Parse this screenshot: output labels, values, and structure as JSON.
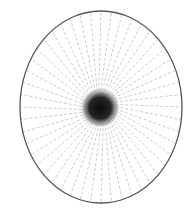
{
  "figure": {
    "ellipse": {
      "cx": 101,
      "cy": 107,
      "rx": 81,
      "ry": 96,
      "stroke": "#555555",
      "stroke_width": 1.3
    },
    "rays": {
      "count": 48,
      "twist_deg": 14,
      "inner_radius_ratio": 0.12,
      "stroke": "#b5b5b5",
      "dash": "3 2",
      "stroke_width": 0.7
    },
    "core": {
      "cx": 100,
      "cy": 108,
      "r": 20,
      "color": "#111111"
    },
    "background": "#ffffff"
  }
}
